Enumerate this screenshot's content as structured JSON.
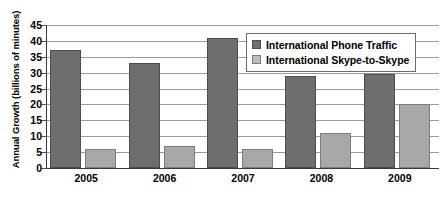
{
  "chart_data": {
    "type": "bar",
    "title": "",
    "xlabel": "",
    "ylabel": "Annual Growth (billions of minutes)",
    "categories": [
      "2005",
      "2006",
      "2007",
      "2008",
      "2009"
    ],
    "series": [
      {
        "name": "International Phone Traffic",
        "color": "#6e6e6e",
        "values": [
          37,
          33,
          41,
          29,
          29.5
        ]
      },
      {
        "name": "International Skype-to-Skype",
        "color": "#a8a8a8",
        "values": [
          6,
          7,
          6,
          11,
          20
        ]
      }
    ],
    "ylim": [
      0,
      45
    ],
    "ytick_step": 5,
    "yticks": [
      "0",
      "5",
      "10",
      "15",
      "20",
      "25",
      "30",
      "35",
      "40",
      "45"
    ],
    "grid": true,
    "legend_position": "upper-right-inside"
  },
  "legend": {
    "items": [
      {
        "label": "International Phone Traffic"
      },
      {
        "label": "International Skype-to-Skype"
      }
    ]
  }
}
